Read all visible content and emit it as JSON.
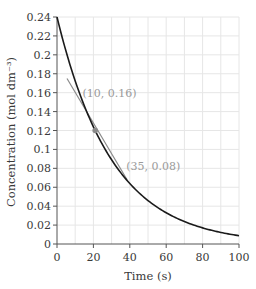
{
  "chart_data": {
    "type": "line",
    "title": "",
    "xlabel": "Time (s)",
    "ylabel": "Concentration (mol dm⁻³)",
    "xlim": [
      0,
      100
    ],
    "ylim": [
      0,
      0.24
    ],
    "xticks": [
      0,
      20,
      40,
      60,
      80,
      100
    ],
    "xtick_labels": [
      "0",
      "20",
      "40",
      "60",
      "80",
      "100"
    ],
    "yticks": [
      0,
      0.02,
      0.04,
      0.06,
      0.08,
      0.1,
      0.12,
      0.14,
      0.16,
      0.18,
      0.2,
      0.22,
      0.24
    ],
    "ytick_labels": [
      "0",
      "0.02",
      "0.04",
      "0.06",
      "0.08",
      "0.1",
      "0.12",
      "0.14",
      "0.16",
      "0.18",
      "0.2",
      "0.22",
      "0.24"
    ],
    "grid": true,
    "grid_x_step": 10,
    "grid_y_step": 0.02,
    "series": [
      {
        "name": "concentration",
        "color": "#1a1a1a",
        "x": [
          0,
          5,
          10,
          15,
          20,
          25,
          30,
          35,
          40,
          45,
          50,
          55,
          60,
          65,
          70,
          75,
          80,
          85,
          90,
          95,
          100
        ],
        "values": [
          0.24,
          0.203,
          0.172,
          0.146,
          0.124,
          0.105,
          0.089,
          0.076,
          0.064,
          0.054,
          0.046,
          0.039,
          0.033,
          0.028,
          0.024,
          0.02,
          0.017,
          0.014,
          0.012,
          0.01,
          0.0088
        ]
      },
      {
        "name": "tangent",
        "color": "#8a8a8a",
        "x": [
          5.5,
          38.5
        ],
        "values": [
          0.175,
          0.068
        ]
      }
    ],
    "points": [
      {
        "label": "tangent point",
        "x": 21,
        "y": 0.12,
        "color": "#8a8a8a"
      }
    ],
    "annotations": [
      {
        "text": "(10, 0.16)",
        "x": 14,
        "y": 0.16
      },
      {
        "text": "(35, 0.08)",
        "x": 38,
        "y": 0.0825
      }
    ]
  }
}
